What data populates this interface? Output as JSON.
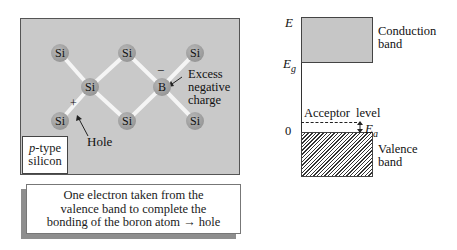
{
  "lattice": {
    "atoms": [
      {
        "symbol": "Si",
        "x": 60,
        "y": 53
      },
      {
        "symbol": "Si",
        "x": 127,
        "y": 53
      },
      {
        "symbol": "Si",
        "x": 195,
        "y": 53
      },
      {
        "symbol": "Si",
        "x": 90,
        "y": 87
      },
      {
        "symbol": "B",
        "x": 162,
        "y": 87
      },
      {
        "symbol": "Si",
        "x": 60,
        "y": 121
      },
      {
        "symbol": "Si",
        "x": 127,
        "y": 121
      },
      {
        "symbol": "Si",
        "x": 195,
        "y": 121
      }
    ],
    "minus_sign": "−",
    "plus_sign": "+",
    "excess_label_1": "Excess",
    "excess_label_2": "negative",
    "excess_label_3": "charge",
    "hole_label": "Hole",
    "ptype_italic": "p",
    "ptype_rest": "-type",
    "ptype_line2": "silicon"
  },
  "caption": {
    "line1": "One electron taken from the",
    "line2": "valence band to complete the",
    "line3_a": "bonding of the boron atom",
    "arrow": "→",
    "line3_b": "hole"
  },
  "energy_diagram": {
    "axis_E": "E",
    "axis_Eg": "E",
    "axis_Eg_sub": "g",
    "axis_zero": "0",
    "conduction_1": "Conduction",
    "conduction_2": "band",
    "acceptor": "Acceptor  level",
    "ea": "E",
    "ea_sub": "a",
    "valence_1": "Valence",
    "valence_2": "band"
  }
}
